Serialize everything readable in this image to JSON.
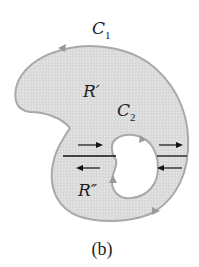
{
  "diagram": {
    "caption": "(b)",
    "labels": {
      "outer_curve": "C",
      "outer_curve_sub": "1",
      "inner_curve": "C",
      "inner_curve_sub": "2",
      "region_upper": "R′",
      "region_lower": "R″"
    },
    "colors": {
      "region_fill": "#dcdcdc",
      "boundary": "#a9a9a9",
      "cut_line": "#111111",
      "arrows": "#111111"
    }
  }
}
